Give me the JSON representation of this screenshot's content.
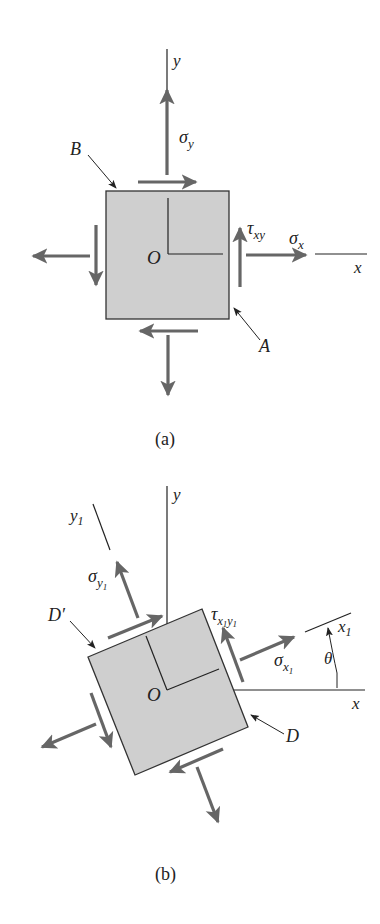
{
  "figure_a": {
    "caption": "(a)",
    "axis_x": "x",
    "axis_y": "y",
    "origin": "O",
    "sigma_x": "σ",
    "sigma_x_sub": "x",
    "sigma_y": "σ",
    "sigma_y_sub": "y",
    "tau": "τ",
    "tau_sub": "xy",
    "point_A": "A",
    "point_B": "B"
  },
  "figure_b": {
    "caption": "(b)",
    "axis_x": "x",
    "axis_y": "y",
    "axis_x1": "x",
    "axis_x1_sub": "1",
    "axis_y1": "y",
    "axis_y1_sub": "1",
    "origin": "O",
    "sigma_x1": "σ",
    "sigma_x1_sub": "x",
    "sigma_x1_subsub": "1",
    "sigma_y1": "σ",
    "sigma_y1_sub": "y",
    "sigma_y1_subsub": "1",
    "tau": "τ",
    "tau_sub_x": "x",
    "tau_sub_1a": "1",
    "tau_sub_y": "y",
    "tau_sub_1b": "1",
    "angle": "θ",
    "point_D": "D",
    "point_D_prime": "D′"
  },
  "colors": {
    "element_fill": "#cfcfcf",
    "arrow": "#666666",
    "line": "#222222"
  }
}
